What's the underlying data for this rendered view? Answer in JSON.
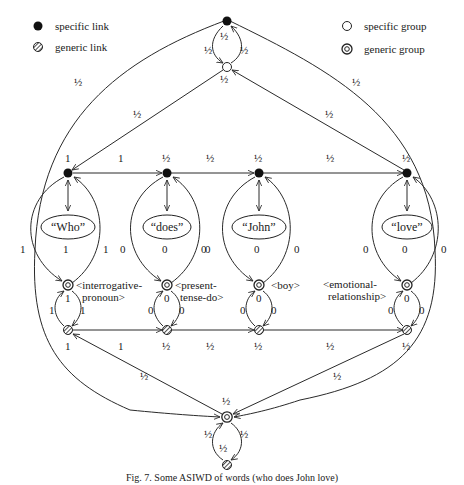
{
  "legend": {
    "specific_link": "specific link",
    "generic_link": "generic link",
    "specific_group": "specific group",
    "generic_group": "generic group"
  },
  "colors": {
    "stroke": "#2a2a2a",
    "node_fill": "#111111",
    "background": "#ffffff"
  },
  "columns": [
    {
      "word": "“Who”",
      "group_line1": "<interrogative-",
      "group_line2": "pronoun>",
      "top_weight": "1",
      "bottom_weight": "1",
      "left_arc": "1",
      "center": "1",
      "right_arc": "1",
      "lower_center": "1",
      "lower_left": "1",
      "lower_right": "1"
    },
    {
      "word": "“does”",
      "group_line1": "<present-",
      "group_line2": "tense-do>",
      "top_weight": "½",
      "bottom_weight": "½",
      "left_arc": "0",
      "center": "0",
      "right_arc": "0",
      "lower_center": "0",
      "lower_left": "0",
      "lower_right": "0"
    },
    {
      "word": "“John”",
      "group_line1": "<boy>",
      "group_line2": "",
      "top_weight": "½",
      "bottom_weight": "½",
      "left_arc": "0",
      "center": "0",
      "right_arc": "0",
      "lower_center": "0",
      "lower_left": "0",
      "lower_right": "0"
    },
    {
      "word": "“love”",
      "group_line1": "<emotional-",
      "group_line2": "relationship>",
      "top_weight": "½",
      "bottom_weight": "½",
      "left_arc": "0",
      "center": "0",
      "right_arc": "0",
      "lower_center": "0",
      "lower_left": "0",
      "lower_right": "0"
    }
  ],
  "top_chain_weights": [
    "1",
    "½",
    "½"
  ],
  "bottom_chain_weights": [
    "1",
    "½",
    "½"
  ],
  "top_hub": {
    "loop_left": "½",
    "loop_right": "½",
    "loop_top": "½",
    "edge_left_outer": "½",
    "edge_left_inner": "½",
    "edge_right_outer": "½",
    "edge_right_inner": "½"
  },
  "bottom_hub": {
    "loop_left": "½",
    "loop_right": "½",
    "loop_bottom": "½",
    "top_weight": "½",
    "edge_left_inner": "½",
    "edge_right_inner": "½"
  },
  "caption": "Fig. 7. Some ASIWD of words (who does John love)"
}
